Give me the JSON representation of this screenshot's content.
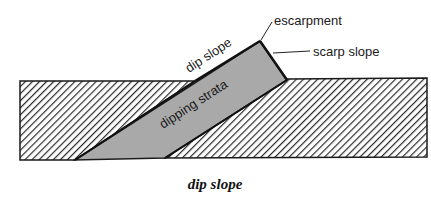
{
  "diagram": {
    "caption": "dip slope",
    "labels": {
      "escarpment": "escarpment",
      "scarp_slope": "scarp slope",
      "dip_slope": "dip slope",
      "dipping_strata": "dipping strata"
    },
    "colors": {
      "strata_fill": "#a9a9a9",
      "hatch_line": "#2a2a2a",
      "outline": "#1a1a1a",
      "background": "#ffffff"
    }
  }
}
